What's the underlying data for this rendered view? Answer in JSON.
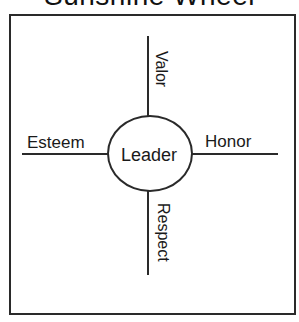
{
  "diagram": {
    "title": "Sunshine Wheel",
    "center": "Leader",
    "spokes": {
      "top": "Valor",
      "right": "Honor",
      "bottom": "Respect",
      "left": "Esteem"
    }
  },
  "colors": {
    "stroke": "#2a2a2a",
    "text": "#1a1a1a",
    "background": "#ffffff"
  }
}
